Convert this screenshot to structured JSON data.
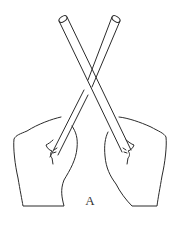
{
  "figure": {
    "caption_label": "A",
    "line_color": "#2b2b2b",
    "background": "#ffffff"
  }
}
